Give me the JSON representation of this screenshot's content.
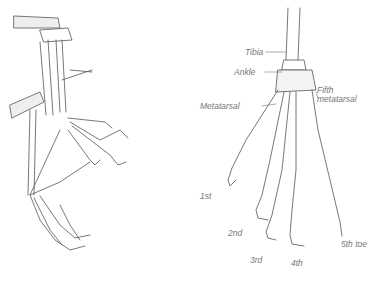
{
  "figure": {
    "left_view": {
      "description": "Side view of folded foot skeleton"
    },
    "right_view": {
      "labels": {
        "tibia": "Tibia",
        "ankle": "Ankle",
        "metatarsal": "Metatarsal",
        "fifth_metatarsal_line1": "Fifth",
        "fifth_metatarsal_line2": "metatarsal",
        "toe1": "1st",
        "toe2": "2nd",
        "toe3": "3rd",
        "toe4": "4th",
        "toe5": "5th toe"
      }
    }
  },
  "colors": {
    "ink": "#555555",
    "label": "#777777"
  }
}
